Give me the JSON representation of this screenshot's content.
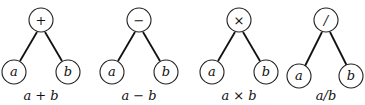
{
  "trees": [
    {
      "operator": "+",
      "left": "a",
      "right": "b",
      "caption": "a + b",
      "cx": 41
    },
    {
      "operator": "−",
      "left": "a",
      "right": "b",
      "caption": "a − b",
      "cx": 139
    },
    {
      "operator": "×",
      "left": "a",
      "right": "b",
      "caption": "a × b",
      "cx": 239
    },
    {
      "operator": "/",
      "left": "a",
      "right": "b",
      "caption": "a/b",
      "cx": 326
    }
  ]
}
